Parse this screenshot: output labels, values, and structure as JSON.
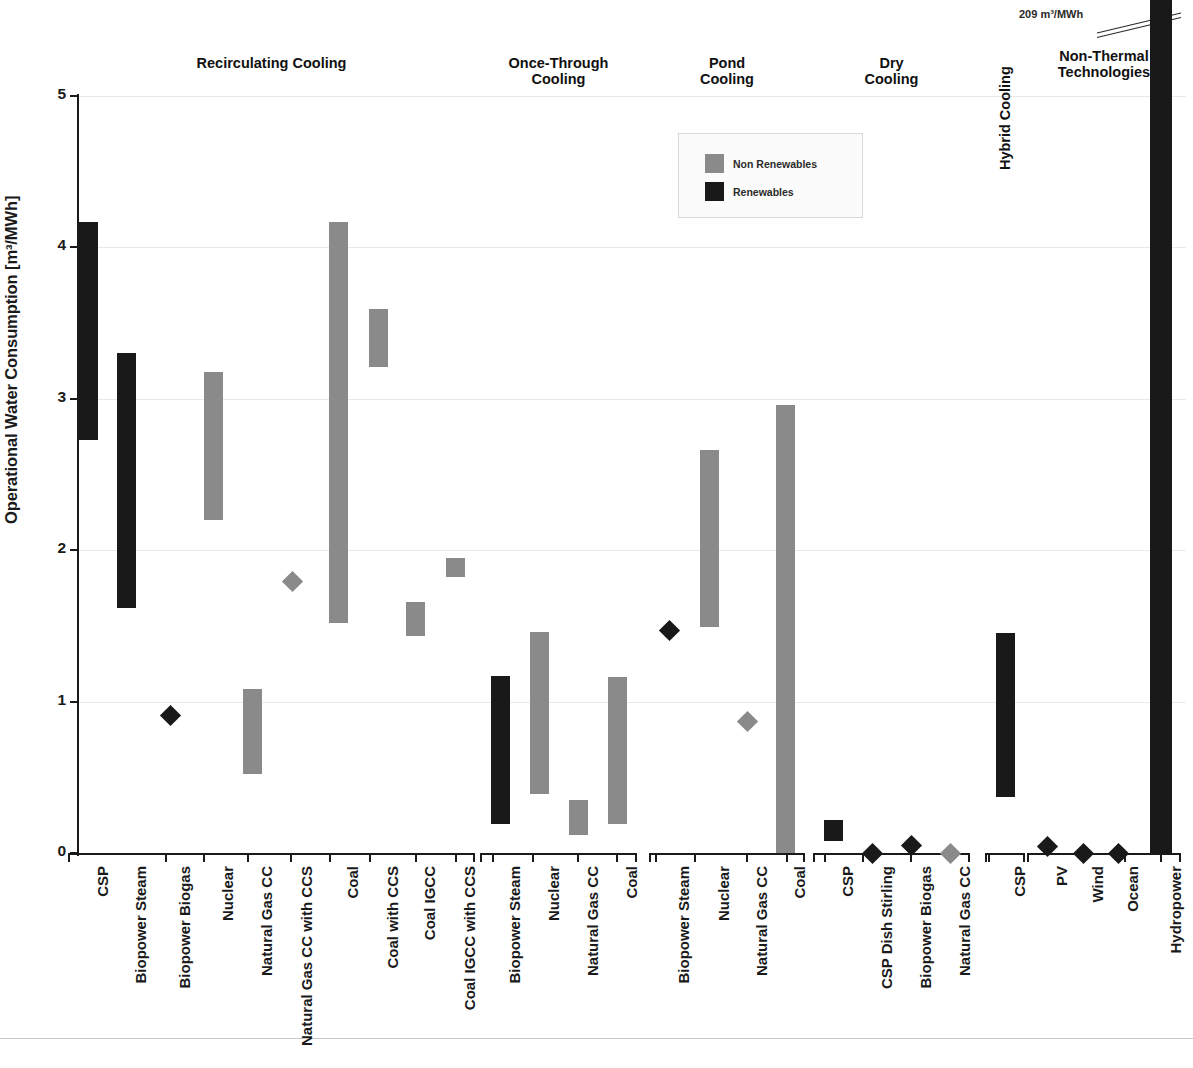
{
  "axis": {
    "y_title": "Operational Water Consumption [m³/MWh]",
    "y_ticks": [
      "0",
      "1",
      "2",
      "3",
      "4",
      "5"
    ]
  },
  "legend": {
    "non_renewables": "Non Renewables",
    "renewables": "Renewables"
  },
  "annotation": {
    "hydropower_value": "209 m³/MWh"
  },
  "groups": [
    {
      "label": "Recirculating Cooling",
      "rotated": false
    },
    {
      "label": "Once-Through\nCooling",
      "rotated": false
    },
    {
      "label": "Pond\nCooling",
      "rotated": false
    },
    {
      "label": "Dry\nCooling",
      "rotated": false
    },
    {
      "label": "Hybrid Cooling",
      "rotated": true
    },
    {
      "label": "Non-Thermal\nTechnologies",
      "rotated": false
    }
  ],
  "chart_data": {
    "type": "bar",
    "title": "",
    "xlabel": "",
    "ylabel": "Operational Water Consumption [m³/MWh]",
    "ylim": [
      0,
      5
    ],
    "grid": true,
    "legend_position": "top-center",
    "series": [
      {
        "name": "Non Renewables",
        "color": "#8a8a8a"
      },
      {
        "name": "Renewables",
        "color": "#191919"
      }
    ],
    "categories": [
      {
        "group": "Recirculating Cooling",
        "label": "CSP",
        "series": "Renewables",
        "kind": "range",
        "low": 2.73,
        "high": 4.17
      },
      {
        "group": "Recirculating Cooling",
        "label": "Biopower Steam",
        "series": "Renewables",
        "kind": "range",
        "low": 1.62,
        "high": 3.3
      },
      {
        "group": "Recirculating Cooling",
        "label": "Biopower Biogas",
        "series": "Renewables",
        "kind": "point",
        "value": 0.91
      },
      {
        "group": "Recirculating Cooling",
        "label": "Nuclear",
        "series": "Non Renewables",
        "kind": "range",
        "low": 2.2,
        "high": 3.18
      },
      {
        "group": "Recirculating Cooling",
        "label": "Natural Gas CC",
        "series": "Non Renewables",
        "kind": "range",
        "low": 0.52,
        "high": 1.08
      },
      {
        "group": "Recirculating Cooling",
        "label": "Natural Gas CC with CCS",
        "series": "Non Renewables",
        "kind": "point",
        "value": 1.79
      },
      {
        "group": "Recirculating Cooling",
        "label": "Coal",
        "series": "Non Renewables",
        "kind": "range",
        "low": 1.52,
        "high": 4.17
      },
      {
        "group": "Recirculating Cooling",
        "label": "Coal with CCS",
        "series": "Non Renewables",
        "kind": "range",
        "low": 3.21,
        "high": 3.59
      },
      {
        "group": "Recirculating Cooling",
        "label": "Coal IGCC",
        "series": "Non Renewables",
        "kind": "range",
        "low": 1.43,
        "high": 1.66
      },
      {
        "group": "Recirculating Cooling",
        "label": "Coal IGCC with CCS",
        "series": "Non Renewables",
        "kind": "range",
        "low": 1.82,
        "high": 1.95
      },
      {
        "group": "Once-Through Cooling",
        "label": "Biopower Steam",
        "series": "Renewables",
        "kind": "range",
        "low": 0.19,
        "high": 1.17
      },
      {
        "group": "Once-Through Cooling",
        "label": "Nuclear",
        "series": "Non Renewables",
        "kind": "range",
        "low": 0.39,
        "high": 1.46
      },
      {
        "group": "Once-Through Cooling",
        "label": "Natural Gas CC",
        "series": "Non Renewables",
        "kind": "range",
        "low": 0.12,
        "high": 0.35
      },
      {
        "group": "Once-Through Cooling",
        "label": "Coal",
        "series": "Non Renewables",
        "kind": "range",
        "low": 0.19,
        "high": 1.16
      },
      {
        "group": "Pond Cooling",
        "label": "Biopower Steam",
        "series": "Renewables",
        "kind": "point",
        "value": 1.47
      },
      {
        "group": "Pond Cooling",
        "label": "Nuclear",
        "series": "Non Renewables",
        "kind": "range",
        "low": 1.49,
        "high": 2.66
      },
      {
        "group": "Pond Cooling",
        "label": "Natural Gas CC",
        "series": "Non Renewables",
        "kind": "point",
        "value": 0.87
      },
      {
        "group": "Pond Cooling",
        "label": "Coal",
        "series": "Non Renewables",
        "kind": "range",
        "low": 0.0,
        "high": 2.96
      },
      {
        "group": "Dry Cooling",
        "label": "CSP",
        "series": "Renewables",
        "kind": "range",
        "low": 0.08,
        "high": 0.22
      },
      {
        "group": "Dry Cooling",
        "label": "CSP Dish Stirling",
        "series": "Renewables",
        "kind": "point",
        "value": 0.0
      },
      {
        "group": "Dry Cooling",
        "label": "Biopower Biogas",
        "series": "Renewables",
        "kind": "point",
        "value": 0.05
      },
      {
        "group": "Dry Cooling",
        "label": "Natural Gas CC",
        "series": "Non Renewables",
        "kind": "point",
        "value": 0.0
      },
      {
        "group": "Hybrid Cooling",
        "label": "CSP",
        "series": "Renewables",
        "kind": "range",
        "low": 0.37,
        "high": 1.45
      },
      {
        "group": "Non-Thermal Technologies",
        "label": "PV",
        "series": "Renewables",
        "kind": "point",
        "value": 0.04
      },
      {
        "group": "Non-Thermal Technologies",
        "label": "Wind",
        "series": "Renewables",
        "kind": "point",
        "value": 0.0
      },
      {
        "group": "Non-Thermal Technologies",
        "label": "Ocean",
        "series": "Renewables",
        "kind": "point",
        "value": 0.0
      },
      {
        "group": "Non-Thermal Technologies",
        "label": "Hydropower",
        "series": "Renewables",
        "kind": "range",
        "low": 0.0,
        "high": 209,
        "offscale": true
      }
    ]
  }
}
